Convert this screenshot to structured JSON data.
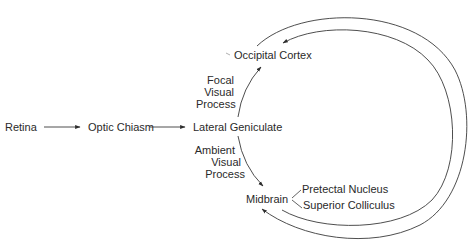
{
  "diagram": {
    "nodes": {
      "retina": "Retina",
      "optic_chiasm": "Optic Chiasm",
      "lateral_geniculate": "Lateral Geniculate",
      "occipital_cortex": "Occipital Cortex",
      "midbrain": "Midbrain",
      "pretectal_nucleus": "Pretectal Nucleus",
      "superior_colliculus": "Superior Colliculus"
    },
    "pathways": {
      "focal": [
        "Focal",
        "Visual",
        "Process"
      ],
      "ambient": [
        "Ambient",
        "Visual",
        "Process"
      ]
    },
    "edges": [
      {
        "from": "Retina",
        "to": "Optic Chiasm"
      },
      {
        "from": "Optic Chiasm",
        "to": "Lateral Geniculate"
      },
      {
        "from": "Lateral Geniculate",
        "to": "Occipital Cortex",
        "label": "Focal Visual Process"
      },
      {
        "from": "Lateral Geniculate",
        "to": "Midbrain",
        "label": "Ambient Visual Process"
      },
      {
        "from": "Midbrain",
        "to": "Pretectal Nucleus"
      },
      {
        "from": "Midbrain",
        "to": "Superior Colliculus"
      },
      {
        "from": "Midbrain",
        "to": "Occipital Cortex",
        "style": "outer-loop"
      },
      {
        "from": "Occipital Cortex",
        "to": "Midbrain",
        "style": "outer-loop"
      }
    ],
    "colors": {
      "line": "#3a3a3a",
      "text": "#2a2a2a",
      "background": "#ffffff"
    }
  }
}
